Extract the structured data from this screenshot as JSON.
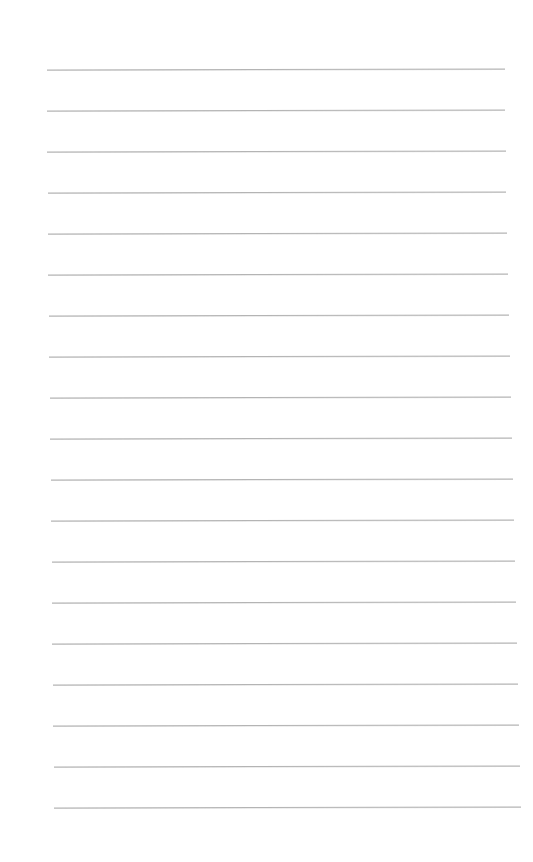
{
  "page": {
    "type": "lined-paper",
    "background_color": "#ffffff",
    "rule_color": "#b4b4b4",
    "rule_count": 19,
    "rules": [
      {
        "y": 69,
        "x1": 47,
        "x2": 505
      },
      {
        "y": 110,
        "x1": 47,
        "x2": 505
      },
      {
        "y": 151,
        "x1": 47,
        "x2": 506
      },
      {
        "y": 192,
        "x1": 48,
        "x2": 506
      },
      {
        "y": 233,
        "x1": 48,
        "x2": 507
      },
      {
        "y": 274,
        "x1": 48,
        "x2": 508
      },
      {
        "y": 315,
        "x1": 49,
        "x2": 509
      },
      {
        "y": 356,
        "x1": 49,
        "x2": 510
      },
      {
        "y": 397,
        "x1": 50,
        "x2": 511
      },
      {
        "y": 438,
        "x1": 50,
        "x2": 512
      },
      {
        "y": 479,
        "x1": 51,
        "x2": 513
      },
      {
        "y": 520,
        "x1": 51,
        "x2": 514
      },
      {
        "y": 561,
        "x1": 52,
        "x2": 515
      },
      {
        "y": 602,
        "x1": 52,
        "x2": 516
      },
      {
        "y": 643,
        "x1": 52,
        "x2": 517
      },
      {
        "y": 684,
        "x1": 53,
        "x2": 518
      },
      {
        "y": 725,
        "x1": 53,
        "x2": 519
      },
      {
        "y": 766,
        "x1": 54,
        "x2": 520
      },
      {
        "y": 807,
        "x1": 54,
        "x2": 521
      }
    ]
  }
}
